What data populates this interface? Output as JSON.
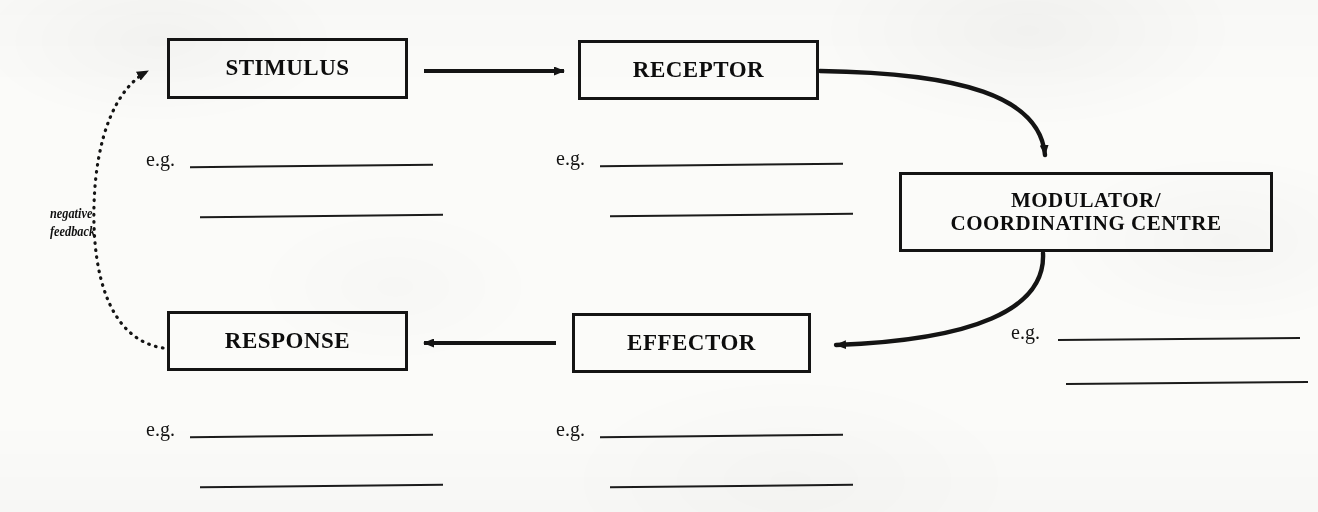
{
  "diagram": {
    "nodes": {
      "stimulus": "STIMULUS",
      "receptor": "RECEPTOR",
      "modulator": "MODULATOR/\nCOORDINATING CENTRE",
      "response": "RESPONSE",
      "effector": "EFFECTOR"
    },
    "feedback_label": "negative\nfeedback",
    "eg_label": "e.g.",
    "answer_groups": [
      {
        "id": "stimulus-examples",
        "label": "e.g.",
        "blank_lines": 2
      },
      {
        "id": "receptor-examples",
        "label": "e.g.",
        "blank_lines": 2
      },
      {
        "id": "modulator-examples",
        "label": "e.g.",
        "blank_lines": 2
      },
      {
        "id": "response-examples",
        "label": "e.g.",
        "blank_lines": 2
      },
      {
        "id": "effector-examples",
        "label": "e.g.",
        "blank_lines": 2
      }
    ],
    "connectors": [
      {
        "from": "stimulus",
        "to": "receptor",
        "style": "straight",
        "direction": "right"
      },
      {
        "from": "receptor",
        "to": "modulator",
        "style": "curved",
        "direction": "down-right"
      },
      {
        "from": "modulator",
        "to": "effector",
        "style": "curved",
        "direction": "down-left"
      },
      {
        "from": "effector",
        "to": "response",
        "style": "straight",
        "direction": "left"
      },
      {
        "from": "response",
        "to": "stimulus",
        "style": "dotted-curved",
        "direction": "up",
        "label": "negative feedback"
      }
    ],
    "colors": {
      "ink": "#141414",
      "paper": "#fbfbf9",
      "rule": "#1b1b1b"
    }
  }
}
